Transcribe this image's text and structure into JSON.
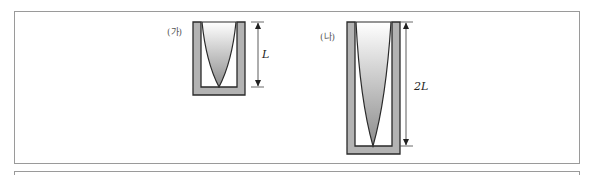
{
  "figure": {
    "panels": [
      {
        "id": "a",
        "label": "(가)",
        "dimension_label": "L",
        "description": "Short U-shaped container with cone-shaped gradient-filled column"
      },
      {
        "id": "b",
        "label": "(나)",
        "dimension_label": "2L",
        "description": "Tall U-shaped container (twice the height) with cone-shaped gradient-filled column"
      }
    ],
    "colors": {
      "wall_fill": "#b3b3b3",
      "wall_stroke": "#2a2a2a",
      "gradient_top": "#ffffff",
      "gradient_bottom": "#8c8c8c",
      "frame": "#9a9a9a"
    }
  }
}
